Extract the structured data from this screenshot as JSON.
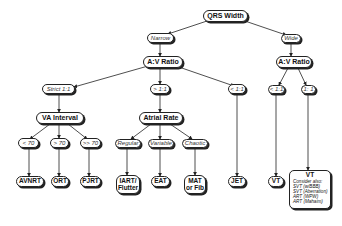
{
  "diagram": {
    "root": {
      "label": "QRS Width"
    },
    "branches": {
      "narrow": {
        "label": "Narrow"
      },
      "wide": {
        "label": "Wide"
      }
    },
    "narrow_av_ratio": {
      "label": "A:V Ratio"
    },
    "wide_av_ratio": {
      "label": "A:V Ratio"
    },
    "edges": {
      "strict_1_1": "Strict 1:1",
      "gt_1_1": "> 1:1",
      "lt_1_1_narrow": "< 1:1",
      "lt_1_1_wide": "< 1:1",
      "eq_1_1_wide": "1: 1",
      "lt70": "< 70",
      "gt70": "> 70",
      "gtgt70": ">> 70",
      "regular": "Regular",
      "variable": "Variable",
      "chaotic": "Chaotic"
    },
    "va_interval": {
      "label": "VA Interval"
    },
    "atrial_rate": {
      "label": "Atrial Rate"
    },
    "results": {
      "avnrt": "AVNRT",
      "ort": "ORT",
      "pjrt": "PJRT",
      "iart_line1": "IART/",
      "iart_line2": "Flutter",
      "eat": "EAT",
      "mat_line1": "MAT",
      "mat_line2": "or Fib",
      "jet": "JET",
      "vt": "VT",
      "vt2": {
        "title": "VT",
        "consider": "Consider also:",
        "items": [
          "SVT (w/BBB)",
          "SVT (Aberration)",
          "ART (WPW)",
          "ART (Mahaim)"
        ]
      }
    }
  }
}
